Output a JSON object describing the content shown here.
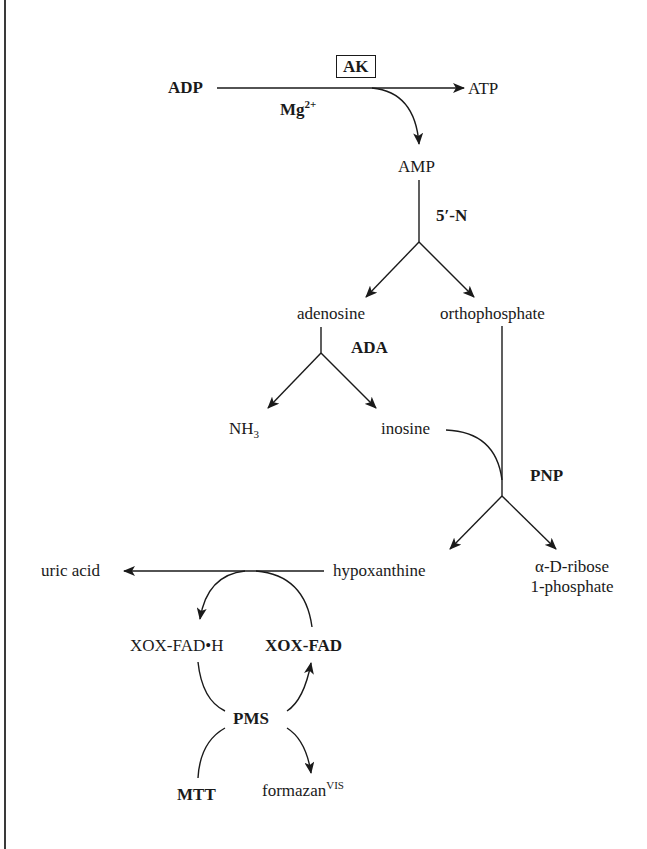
{
  "diagram": {
    "enzymes": {
      "ak": "AK",
      "five_n": "5′-N",
      "ada": "ADA",
      "pnp": "PNP",
      "pms": "PMS"
    },
    "cofactor": {
      "base": "Mg",
      "sup": "2+"
    },
    "nodes": {
      "adp": "ADP",
      "atp": "ATP",
      "amp": "AMP",
      "adenosine": "adenosine",
      "orthophosphate": "orthophosphate",
      "nh3_base": "NH",
      "nh3_sub": "3",
      "inosine": "inosine",
      "hypoxanthine": "hypoxanthine",
      "ribose_line1": "α-D-ribose",
      "ribose_line2": "1-phosphate",
      "uric_acid": "uric acid",
      "xox_fad_h": "XOX-FAD•H",
      "xox_fad": "XOX-FAD",
      "mtt": "MTT",
      "formazan_base": "formazan",
      "formazan_sup": "VIS"
    },
    "colors": {
      "ink": "#1a1a1a",
      "background": "#ffffff",
      "frame": "#3a3a3a"
    }
  }
}
